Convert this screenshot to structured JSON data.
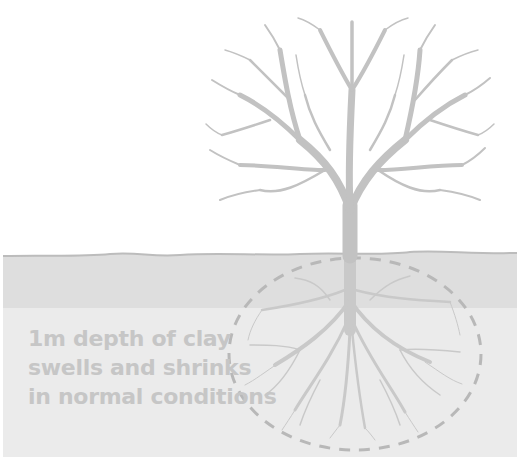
{
  "diagram": {
    "caption_lines": [
      "1m depth of clay",
      "swells and shrinks",
      "in normal conditions"
    ],
    "elements": {
      "tree": "tree-crown-with-bare-branches",
      "ground": "ground-surface-line",
      "clay_layer": "clay-layer-band",
      "subsoil": "subsoil-band",
      "roots": "root-system",
      "root_zone": "dashed-ellipse-root-zone"
    },
    "colors": {
      "background": "#ffffff",
      "tree": "#c2c2c2",
      "ground_line": "#bcbcbc",
      "clay_band": "#dedede",
      "subsoil_band": "#ebebeb",
      "dashed_outline": "#b8b8b8",
      "caption_text": "#c6c6c6"
    }
  }
}
